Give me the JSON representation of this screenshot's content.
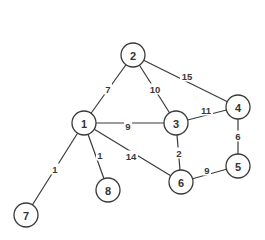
{
  "diagram": {
    "title": "",
    "type": "weighted-undirected-graph",
    "node_radius": 12,
    "colors": {
      "background": "#ffffff",
      "stroke": "#3a3a3a",
      "text": "#333333"
    },
    "nodes": [
      {
        "id": "1",
        "label": "1",
        "x": 84,
        "y": 123
      },
      {
        "id": "2",
        "label": "2",
        "x": 133,
        "y": 55
      },
      {
        "id": "3",
        "label": "3",
        "x": 176,
        "y": 123
      },
      {
        "id": "4",
        "label": "4",
        "x": 238,
        "y": 107
      },
      {
        "id": "5",
        "label": "5",
        "x": 238,
        "y": 166
      },
      {
        "id": "6",
        "label": "6",
        "x": 181,
        "y": 182
      },
      {
        "id": "7",
        "label": "7",
        "x": 26,
        "y": 215
      },
      {
        "id": "8",
        "label": "8",
        "x": 108,
        "y": 190
      }
    ],
    "edges": [
      {
        "from": "1",
        "to": "2",
        "weight": "7",
        "lx": 108,
        "ly": 89
      },
      {
        "from": "2",
        "to": "3",
        "weight": "10",
        "lx": 155,
        "ly": 89
      },
      {
        "from": "2",
        "to": "4",
        "weight": "15",
        "lx": 187,
        "ly": 76
      },
      {
        "from": "1",
        "to": "3",
        "weight": "9",
        "lx": 128,
        "ly": 126
      },
      {
        "from": "3",
        "to": "4",
        "weight": "11",
        "lx": 206,
        "ly": 110
      },
      {
        "from": "3",
        "to": "6",
        "weight": "2",
        "lx": 179,
        "ly": 153
      },
      {
        "from": "4",
        "to": "5",
        "weight": "6",
        "lx": 238,
        "ly": 136
      },
      {
        "from": "6",
        "to": "5",
        "weight": "9",
        "lx": 207,
        "ly": 170
      },
      {
        "from": "1",
        "to": "6",
        "weight": "14",
        "lx": 131,
        "ly": 156
      },
      {
        "from": "1",
        "to": "8",
        "weight": "1",
        "lx": 100,
        "ly": 155
      },
      {
        "from": "1",
        "to": "7",
        "weight": "1",
        "lx": 55,
        "ly": 169
      }
    ]
  }
}
